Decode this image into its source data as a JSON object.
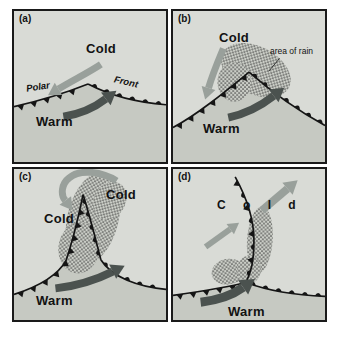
{
  "panels": [
    {
      "tag": "(a)",
      "labels": {
        "cold": "Cold",
        "warm": "Warm",
        "polar": "Polar",
        "front": "Front"
      }
    },
    {
      "tag": "(b)",
      "labels": {
        "cold": "Cold",
        "warm": "Warm",
        "area_of_rain": "area of rain"
      }
    },
    {
      "tag": "(c)",
      "labels": {
        "cold_left": "Cold",
        "cold_right": "Cold",
        "warm": "Warm"
      }
    },
    {
      "tag": "(d)",
      "labels": {
        "cold_spaced": "C o l d",
        "warm": "Warm"
      }
    }
  ],
  "colors": {
    "cold_arrow": "#99a09b",
    "warm_arrow": "#4b524f",
    "front_line": "#151515",
    "panel_bg": "#d9dbd6",
    "warm_sector": "#c6c9c2",
    "stipple_base": "#cbcec7",
    "stipple_dot": "#3d3d3d",
    "border": "#1a1a1a",
    "text": "#121212"
  }
}
